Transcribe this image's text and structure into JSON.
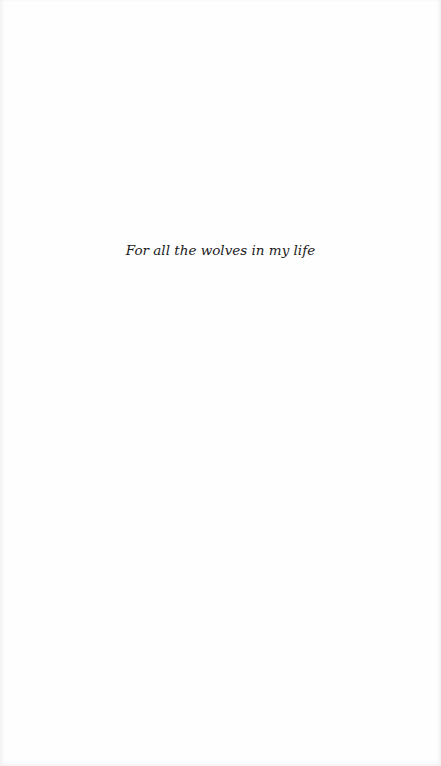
{
  "page": {
    "type": "dedication",
    "background_color": "#fefefe",
    "text_color": "#1c1c1c"
  },
  "dedication": {
    "text": "For all the wolves in my life"
  }
}
